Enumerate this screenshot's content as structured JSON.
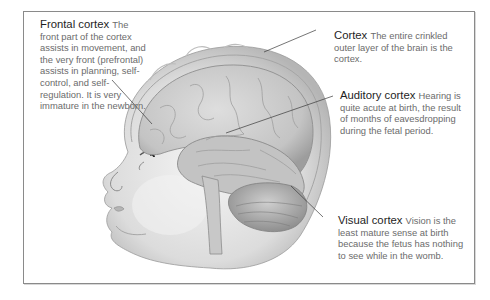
{
  "diagram": {
    "labels": [
      {
        "id": "frontal",
        "title": "Frontal cortex",
        "body": "The front part of the cortex assists in movement, and the very front (prefrontal) assists in planning, self-control, and self-regulation. It is very immature in the newborn."
      },
      {
        "id": "cortex",
        "title": "Cortex",
        "body": "The entire crinkled outer layer of the brain is the cortex."
      },
      {
        "id": "auditory",
        "title": "Auditory cortex",
        "body": "Hearing is quite acute at birth, the result of months of eavesdropping during the fetal period."
      },
      {
        "id": "visual",
        "title": "Visual cortex",
        "body": "Vision is the least mature sense at birth because the fetus has nothing to see while in the womb."
      }
    ],
    "colors": {
      "frame": "#8a8a8a",
      "title_text": "#1e1e1e",
      "body_text": "#6b6b6b",
      "leader_line": "#3a3a3a",
      "skin": "#e9e9e9",
      "brain": "#c9c9c9"
    }
  }
}
